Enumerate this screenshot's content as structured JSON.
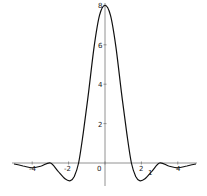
{
  "chart_data": {
    "type": "line",
    "title": "",
    "xlabel": "",
    "ylabel": "",
    "xlim": [
      -5,
      5
    ],
    "ylim": [
      -1,
      8
    ],
    "grid": false,
    "legend": null,
    "x_ticks": [
      -4,
      -2,
      0,
      2,
      4
    ],
    "x_tick_labels": [
      "-4",
      "-2",
      "0",
      "2",
      "4"
    ],
    "y_ticks": [
      2,
      4,
      6,
      8
    ],
    "y_tick_labels": [
      "2",
      "4",
      "6",
      "8"
    ],
    "annotations": [
      {
        "text": "1",
        "x": 2.4,
        "y": -0.5
      }
    ],
    "series": [
      {
        "name": "f(x)",
        "color": "#111111",
        "x": [
          -5.0,
          -4.5,
          -4.0,
          -3.5,
          -3.0,
          -2.6,
          -2.2,
          -1.9,
          -1.7,
          -1.45,
          -1.2,
          -0.9,
          -0.6,
          -0.3,
          0.0,
          0.3,
          0.6,
          0.9,
          1.2,
          1.45,
          1.7,
          1.9,
          2.2,
          2.6,
          3.0,
          3.5,
          4.0,
          4.5,
          5.0
        ],
        "y": [
          -0.05,
          -0.15,
          -0.25,
          -0.15,
          0.0,
          -0.4,
          -0.8,
          -0.9,
          -0.7,
          0.0,
          1.5,
          3.6,
          5.9,
          7.5,
          8.0,
          7.5,
          5.9,
          3.6,
          1.5,
          0.0,
          -0.7,
          -0.9,
          -0.8,
          -0.4,
          0.0,
          -0.15,
          -0.25,
          -0.15,
          -0.05
        ]
      }
    ]
  },
  "labels": {
    "x_ticks": [
      "-4",
      "-2",
      "0",
      "2",
      "4"
    ],
    "y_ticks": [
      "2",
      "4",
      "6",
      "8"
    ],
    "annotation": "1"
  }
}
